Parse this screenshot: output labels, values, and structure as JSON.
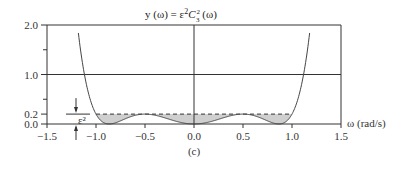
{
  "chart_data": {
    "type": "line",
    "title_parts": {
      "lhs": "y (ω) = ε",
      "sup": "2",
      "c": "C",
      "c_sup": "2",
      "c_sub": "3",
      "rhs": " (ω)"
    },
    "xlabel": "ω (rad/s)",
    "ylabel": "",
    "caption": "(c)",
    "xlim": [
      -1.5,
      1.5
    ],
    "ylim": [
      0.0,
      2.0
    ],
    "x_ticks": [
      -1.5,
      -1.0,
      -0.5,
      0.0,
      0.5,
      1.0,
      1.5
    ],
    "x_tick_labels": [
      "−1.5",
      "−1.0",
      "−0.5",
      "0.0",
      "0.5",
      "1.0",
      "1.5"
    ],
    "y_ticks": [
      0.0,
      0.2,
      1.0,
      2.0
    ],
    "y_tick_labels": [
      "0.0",
      "0.2",
      "1.0",
      "2.0"
    ],
    "y_minor_ticks": [
      0.5,
      1.5
    ],
    "grid": {
      "horizontal_lines": [
        1.0,
        2.0
      ],
      "vertical_lines": [
        0.0,
        1.5
      ]
    },
    "epsilon_squared": 0.2,
    "epsilon_label": "ε²",
    "passband": [
      -1.0,
      1.0
    ],
    "series": [
      {
        "name": "y(ω) = ε² C3²(ω)",
        "formula": "0.2 * (4ω³ − 3ω)²",
        "x": [
          -1.18,
          -1.15,
          -1.1,
          -1.05,
          -1.0,
          -0.95,
          -0.9,
          -0.866,
          -0.8,
          -0.7,
          -0.6,
          -0.5,
          -0.4,
          -0.3,
          -0.2,
          -0.1,
          0.0,
          0.1,
          0.2,
          0.3,
          0.4,
          0.5,
          0.6,
          0.7,
          0.8,
          0.866,
          0.9,
          0.95,
          1.0,
          1.05,
          1.1,
          1.15,
          1.18
        ],
        "values": [
          1.84,
          1.43,
          0.87,
          0.47,
          0.2,
          0.05,
          0.003,
          0.0,
          0.04,
          0.15,
          0.2,
          0.2,
          0.16,
          0.1,
          0.06,
          0.02,
          0.0,
          0.02,
          0.06,
          0.1,
          0.16,
          0.2,
          0.2,
          0.15,
          0.04,
          0.0,
          0.003,
          0.05,
          0.2,
          0.47,
          0.87,
          1.43,
          1.84
        ]
      }
    ],
    "annotations": [
      "dashed line at y = ε² = 0.2 over −1 ≤ ω ≤ 1",
      "shaded region between curve and ε² line in passband",
      "ε² dimension arrows at ω ≈ −1.2"
    ]
  }
}
